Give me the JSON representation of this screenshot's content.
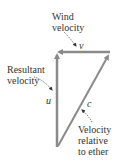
{
  "diagram": {
    "labels": {
      "wind": [
        "Wind",
        "velocity"
      ],
      "resultant": [
        "Resultant",
        "velocity"
      ],
      "ether": [
        "Velocity",
        "relative",
        "to ether"
      ]
    },
    "vectors": {
      "v": "v⃗",
      "u": "u⃗",
      "c": "c⃗"
    },
    "colors": {
      "arrow": "#8a8a8a",
      "text": "#333333",
      "dotted": "#333333"
    }
  }
}
